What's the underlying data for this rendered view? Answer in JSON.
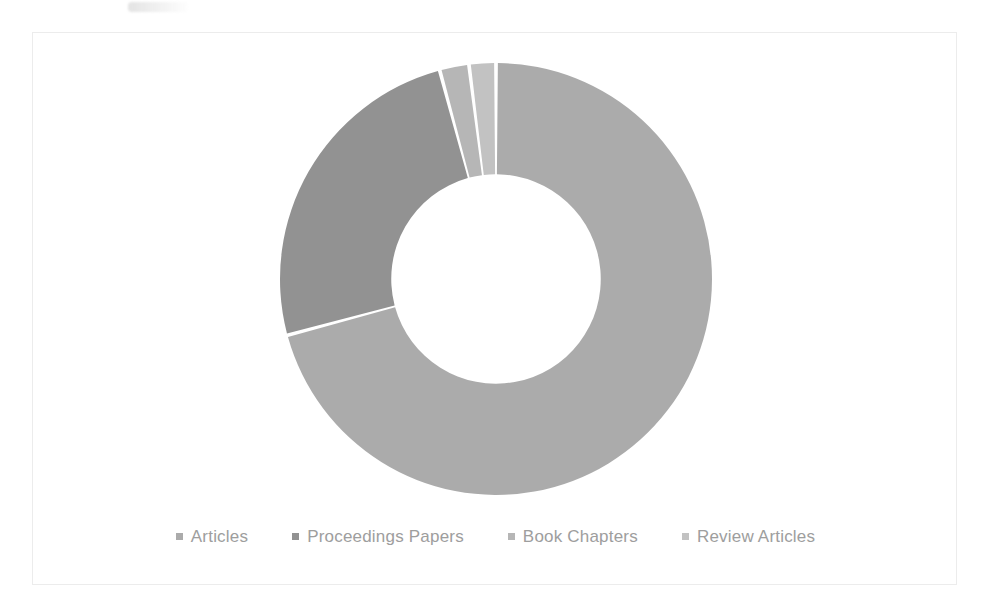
{
  "figure": {
    "background_color": "#ffffff",
    "card_border_color": "#ececec",
    "card_background": "#ffffff"
  },
  "legend": {
    "position": "bottom",
    "marker_shape": "square",
    "text_color": "#9b9b9b",
    "items": [
      {
        "label": "Articles",
        "color": "#a9a9a9"
      },
      {
        "label": "Proceedings Papers",
        "color": "#8f8f8f"
      },
      {
        "label": "Book Chapters",
        "color": "#b4b4b4"
      },
      {
        "label": "Review Articles",
        "color": "#c0c0c0"
      }
    ]
  },
  "chart_data": {
    "type": "pie",
    "variant": "donut",
    "title": "",
    "subtitle": "",
    "xlabel": "",
    "ylabel": "",
    "grid": false,
    "legend_position": "bottom",
    "start_angle_deg": 0,
    "direction": "clockwise",
    "inner_radius_ratio": 0.485,
    "labels": [
      "Articles",
      "Proceedings Papers",
      "Book Chapters",
      "Review Articles"
    ],
    "values": [
      70.8,
      25.0,
      2.2,
      2.0
    ],
    "units": "percent",
    "slices": [
      {
        "label": "Articles",
        "value": 70.8,
        "color": "#a9a9a9",
        "start_deg": 0.0,
        "end_deg": 254.9
      },
      {
        "label": "Proceedings Papers",
        "value": 25.0,
        "color": "#8f8f8f",
        "start_deg": 254.9,
        "end_deg": 344.9
      },
      {
        "label": "Book Chapters",
        "value": 2.2,
        "color": "#b4b4b4",
        "start_deg": 344.9,
        "end_deg": 352.8
      },
      {
        "label": "Review Articles",
        "value": 2.0,
        "color": "#c0c0c0",
        "start_deg": 352.8,
        "end_deg": 360.0
      }
    ]
  }
}
